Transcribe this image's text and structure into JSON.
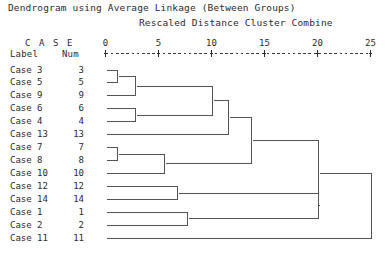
{
  "titles": {
    "main": "Dendrogram using Average Linkage (Between Groups)",
    "sub": "Rescaled Distance Cluster Combine"
  },
  "column_headers": {
    "case": "C A S E",
    "label": "Label",
    "num": "Num"
  },
  "axis": {
    "ticks": [
      "0",
      "5",
      "10",
      "15",
      "20",
      "25"
    ],
    "tick_values": [
      0,
      5,
      10,
      15,
      20,
      25
    ],
    "min": 0,
    "max": 25,
    "ruler_glyph": "+---------+---------+---------+---------+---------+"
  },
  "colors": {
    "background": "#ffffff",
    "text": "#2b2b2b",
    "line": "#555555"
  },
  "chart_data": {
    "type": "dendrogram",
    "title": "Dendrogram using Average Linkage (Between Groups)",
    "xlabel": "Rescaled Distance Cluster Combine",
    "ylabel": "",
    "xlim": [
      0,
      25
    ],
    "grid": false,
    "legend": "none",
    "leaf_order": [
      {
        "label": "Case 3",
        "num": "3"
      },
      {
        "label": "Case 5",
        "num": "5"
      },
      {
        "label": "Case 9",
        "num": "9"
      },
      {
        "label": "Case 6",
        "num": "6"
      },
      {
        "label": "Case 4",
        "num": "4"
      },
      {
        "label": "Case 13",
        "num": "13"
      },
      {
        "label": "Case 7",
        "num": "7"
      },
      {
        "label": "Case 8",
        "num": "8"
      },
      {
        "label": "Case 10",
        "num": "10"
      },
      {
        "label": "Case 12",
        "num": "12"
      },
      {
        "label": "Case 14",
        "num": "14"
      },
      {
        "label": "Case 1",
        "num": "1"
      },
      {
        "label": "Case 2",
        "num": "2"
      },
      {
        "label": "Case 11",
        "num": "11"
      }
    ],
    "merges": [
      {
        "id": "m1",
        "left": "Case 3",
        "right": "Case 5",
        "distance": 1.1
      },
      {
        "id": "m2",
        "left": "m1",
        "right": "Case 9",
        "distance": 2.8
      },
      {
        "id": "m3",
        "left": "Case 6",
        "right": "Case 4",
        "distance": 2.8
      },
      {
        "id": "m4",
        "left": "m2",
        "right": "m3",
        "distance": 10.0
      },
      {
        "id": "m5",
        "left": "m4",
        "right": "Case 13",
        "distance": 11.6
      },
      {
        "id": "m6",
        "left": "Case 7",
        "right": "Case 8",
        "distance": 1.1
      },
      {
        "id": "m7",
        "left": "m6",
        "right": "Case 10",
        "distance": 5.5
      },
      {
        "id": "m8",
        "left": "m5",
        "right": "m7",
        "distance": 13.7
      },
      {
        "id": "m9",
        "left": "Case 12",
        "right": "Case 14",
        "distance": 6.7
      },
      {
        "id": "m10",
        "left": "Case 1",
        "right": "Case 2",
        "distance": 7.7
      },
      {
        "id": "m11",
        "left": "m9",
        "right": "m10",
        "distance": 20.0
      },
      {
        "id": "m12",
        "left": "m8",
        "right": "m11",
        "distance": 20.0
      },
      {
        "id": "m13",
        "left": "m12",
        "right": "Case 11",
        "distance": 25.0
      }
    ]
  }
}
